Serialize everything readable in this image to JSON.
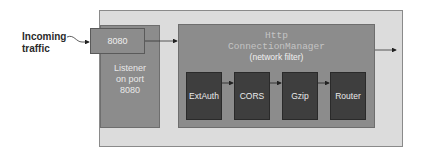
{
  "incoming": {
    "line1": "Incoming",
    "line2": "traffic"
  },
  "listener": {
    "port_label": "8080",
    "label_lines": [
      "Listener",
      "on port",
      "8080"
    ]
  },
  "hcm": {
    "title_line1": "Http",
    "title_line2": "ConnectionManager",
    "subtitle": "(network filter)"
  },
  "filters": [
    {
      "label": "ExtAuth"
    },
    {
      "label": "CORS"
    },
    {
      "label": "Gzip"
    },
    {
      "label": "Router"
    }
  ],
  "colors": {
    "outer_bg": "#dcdcdc",
    "box_mid": "#8c8c8c",
    "filter_dark": "#3e3e3e"
  }
}
